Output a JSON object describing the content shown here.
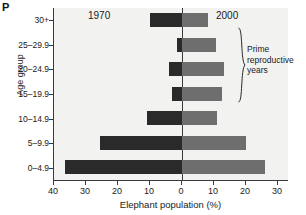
{
  "panel": {
    "letter": "P"
  },
  "axes": {
    "ylabel": "Age group",
    "xlabel": "Elephant population (%)",
    "x_ticks": [
      {
        "label": "40",
        "value": -40
      },
      {
        "label": "30",
        "value": -30
      },
      {
        "label": "20",
        "value": -20
      },
      {
        "label": "10",
        "value": -10
      },
      {
        "label": "0",
        "value": 0
      },
      {
        "label": "10",
        "value": 10
      },
      {
        "label": "20",
        "value": 20
      },
      {
        "label": "30",
        "value": 30
      }
    ]
  },
  "series_labels": {
    "left": "1970",
    "right": "2000"
  },
  "annotation": {
    "line1": "Prime",
    "line2": "reproductive",
    "line3": "years",
    "covers": [
      "15–19.9",
      "20–24.9",
      "25–29.9"
    ]
  },
  "colors": {
    "bar_1970": "#2a2a2a",
    "bar_2000": "#6e6e6e",
    "plot_background": "#f2f2f0",
    "axis": "#3a3a3a"
  },
  "chart_data": {
    "type": "bar",
    "title": "",
    "subtitle": "",
    "xlabel": "Elephant population (%)",
    "ylabel": "Age group",
    "orientation": "horizontal",
    "style": "population-pyramid",
    "xlim": [
      -40,
      30
    ],
    "grid": false,
    "legend_position": "inline-top",
    "categories": [
      "30+",
      "25–29.9",
      "20–24.9",
      "15–19.9",
      "10–14.9",
      "5–9.9",
      "0–4.9"
    ],
    "series": [
      {
        "name": "1970",
        "side": "left",
        "values": [
          10.0,
          1.5,
          4.0,
          3.0,
          11.0,
          25.5,
          36.5
        ]
      },
      {
        "name": "2000",
        "side": "right",
        "values": [
          8.0,
          10.5,
          13.0,
          12.5,
          11.0,
          20.0,
          26.0
        ]
      }
    ],
    "annotations": [
      {
        "text": "Prime reproductive years",
        "applies_to": [
          "15–19.9",
          "20–24.9",
          "25–29.9"
        ]
      }
    ]
  }
}
